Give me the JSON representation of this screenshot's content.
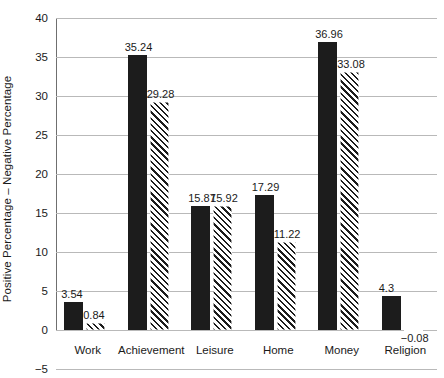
{
  "chart_data": {
    "type": "bar",
    "title": "",
    "subtitle": "",
    "xlabel": "",
    "ylabel": "Positive Percentage – Negative Percentage",
    "categories": [
      "Work",
      "Achievement",
      "Leisure",
      "Home",
      "Money",
      "Religion"
    ],
    "series": [
      {
        "name": "solid-series",
        "style": "solid-black",
        "color": "#1c1c1c",
        "values": [
          3.54,
          35.24,
          15.87,
          17.29,
          36.96,
          4.3
        ],
        "value_labels": [
          "3.54",
          "35.24",
          "15.87",
          "17.29",
          "36.96",
          "4.3"
        ]
      },
      {
        "name": "hatched-series",
        "style": "diagonal-hatch",
        "color": "#1c1c1c",
        "values": [
          0.84,
          29.28,
          15.92,
          11.22,
          33.08,
          -0.08
        ],
        "value_labels": [
          "0.84",
          "29.28",
          "15.92",
          "11.22",
          "33.08",
          "−0.08"
        ]
      }
    ],
    "ylim": [
      -5,
      40
    ],
    "yticks": [
      -5,
      0,
      5,
      10,
      15,
      20,
      25,
      30,
      35,
      40
    ],
    "ytick_labels": [
      "−5",
      "0",
      "5",
      "10",
      "15",
      "20",
      "25",
      "30",
      "35",
      "40"
    ],
    "grid": "horizontal",
    "legend": "none",
    "gridline_color": "#b9b9b9",
    "axis_color": "#6f6f6f",
    "background": "#ffffff"
  }
}
